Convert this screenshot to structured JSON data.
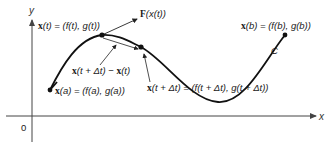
{
  "diagram": {
    "axes": {
      "x_label": "x",
      "y_label": "y",
      "origin_label": "0"
    },
    "curve_label": "C",
    "labels": {
      "x_t": {
        "bold": "x",
        "rest": "(t) = (f(t), g(t))"
      },
      "F_x_t": {
        "bold": "F",
        "rest": "(x(t))"
      },
      "x_b": {
        "bold": "x",
        "rest": "(b) = (f(b), g(b))"
      },
      "diff": {
        "bold1": "x",
        "mid": "(t + Δt) − ",
        "bold2": "x",
        "end": "(t)"
      },
      "x_a": {
        "bold": "x",
        "rest": "(a) = (f(a), g(a))"
      },
      "x_t_dt": {
        "bold": "x",
        "rest": "(t + Δt) = (f(t + Δt), g(t + Δt))"
      }
    },
    "colors": {
      "curve": "#111111",
      "axis": "#444444",
      "text": "#1a1a1a"
    }
  }
}
